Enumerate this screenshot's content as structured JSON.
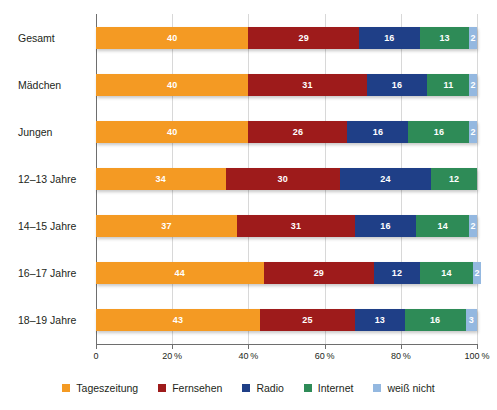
{
  "chart_data": {
    "type": "bar",
    "orientation": "horizontal",
    "stacked": true,
    "title": "",
    "subtitle": "",
    "xlabel": "",
    "ylabel": "",
    "xlim": [
      0,
      100
    ],
    "grid": true,
    "legend_position": "bottom",
    "categories": [
      "Gesamt",
      "Mädchen",
      "Jungen",
      "12–13 Jahre",
      "14–15 Jahre",
      "16–17 Jahre",
      "18–19 Jahre"
    ],
    "series": [
      {
        "name": "Tageszeitung",
        "color": "#F49A23",
        "values": [
          40,
          40,
          40,
          34,
          37,
          44,
          43
        ]
      },
      {
        "name": "Fernsehen",
        "color": "#9E1B1B",
        "values": [
          29,
          31,
          26,
          30,
          31,
          29,
          25
        ]
      },
      {
        "name": "Radio",
        "color": "#1F3F87",
        "values": [
          16,
          16,
          16,
          24,
          16,
          12,
          13
        ]
      },
      {
        "name": "Internet",
        "color": "#2E8B57",
        "values": [
          13,
          11,
          16,
          12,
          14,
          14,
          16
        ]
      },
      {
        "name": "weiß nicht",
        "color": "#94B8E0",
        "values": [
          2,
          2,
          2,
          0,
          2,
          2,
          3
        ]
      }
    ],
    "xticks": [
      0,
      20,
      40,
      60,
      80,
      100
    ],
    "xtick_labels": [
      "0",
      "20 %",
      "40 %",
      "60 %",
      "80 %",
      "100 %"
    ],
    "data_label_color": "#FFFFFF",
    "axis_color": "#6E6E6E",
    "gridline_color": "#D8D8D8",
    "background_color": "#FFFFFF"
  },
  "legend": {
    "items": [
      {
        "label": "Tageszeitung",
        "color": "#F49A23"
      },
      {
        "label": "Fernsehen",
        "color": "#9E1B1B"
      },
      {
        "label": "Radio",
        "color": "#1F3F87"
      },
      {
        "label": "Internet",
        "color": "#2E8B57"
      },
      {
        "label": "weiß nicht",
        "color": "#94B8E0"
      }
    ]
  }
}
